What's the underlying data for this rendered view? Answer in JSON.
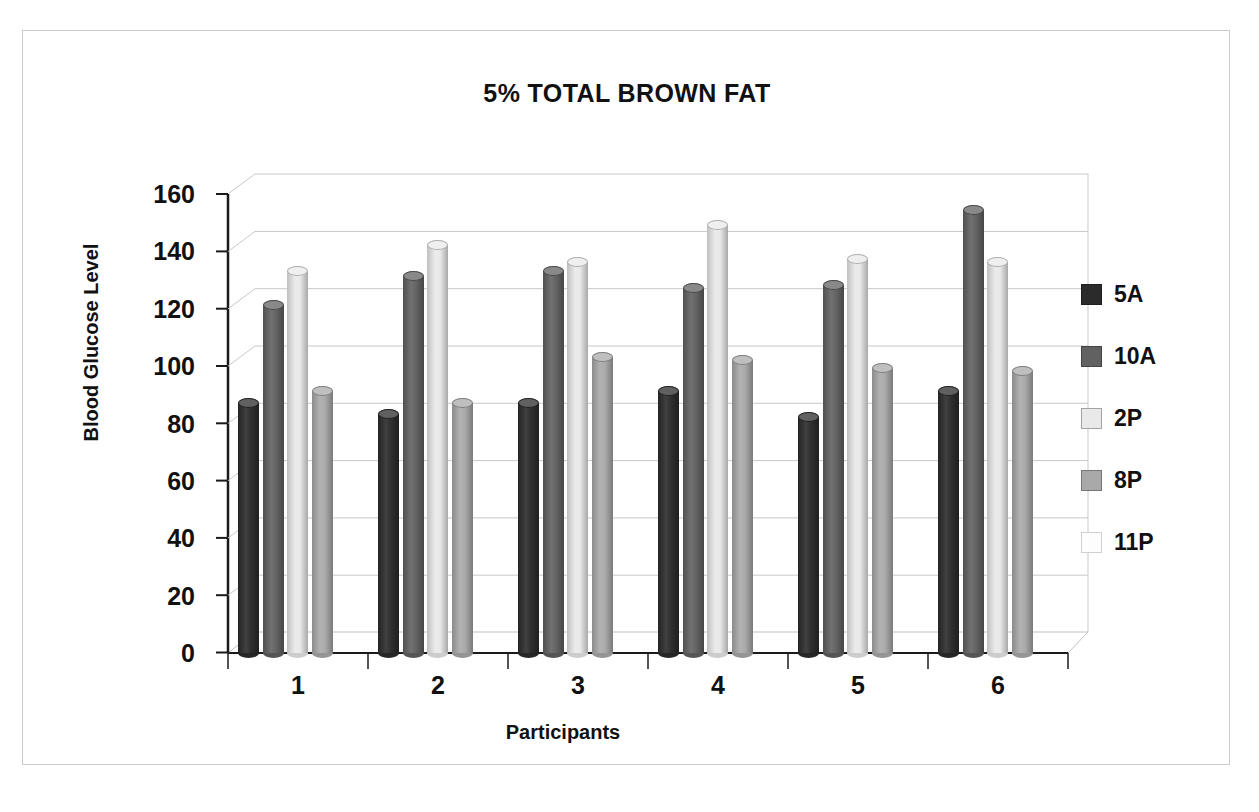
{
  "chart_data": {
    "type": "bar",
    "title": "5% TOTAL BROWN FAT",
    "xlabel": "Participants",
    "ylabel": "Blood Glucose Level",
    "categories": [
      "1",
      "2",
      "3",
      "4",
      "5",
      "6"
    ],
    "ylim": [
      0,
      160
    ],
    "yticks": [
      0,
      20,
      40,
      60,
      80,
      100,
      120,
      140,
      160
    ],
    "ytick_labels": [
      "0",
      "20",
      "40",
      "60",
      "80",
      "100",
      "120",
      "140",
      "160"
    ],
    "grid": true,
    "style": "3d-cylinder",
    "legend_position": "right",
    "series": [
      {
        "name": "5A",
        "color": "#2b2b2b",
        "values": [
          89,
          85,
          89,
          93,
          84,
          93
        ]
      },
      {
        "name": "10A",
        "color": "#616161",
        "values": [
          123,
          133,
          135,
          129,
          130,
          156
        ]
      },
      {
        "name": "2P",
        "color": "#e9e9e9",
        "values": [
          135,
          144,
          138,
          151,
          139,
          138
        ]
      },
      {
        "name": "8P",
        "color": "#a9a9a9",
        "values": [
          93,
          89,
          105,
          104,
          101,
          100
        ]
      },
      {
        "name": "11P",
        "color": "#fdfdfd",
        "values": [
          0,
          0,
          0,
          0,
          0,
          0
        ]
      }
    ]
  },
  "legend": {
    "items": [
      {
        "label": "5A",
        "color": "#2b2b2b"
      },
      {
        "label": "10A",
        "color": "#616161"
      },
      {
        "label": "2P",
        "color": "#e9e9e9"
      },
      {
        "label": "8P",
        "color": "#a9a9a9"
      },
      {
        "label": "11P",
        "color": "#fdfdfd"
      }
    ]
  },
  "colors": {
    "axis": "#1a1a1a",
    "gridline": "#c8c8c8",
    "frame": "#c9cccf",
    "text": "#111111",
    "background": "#ffffff"
  }
}
